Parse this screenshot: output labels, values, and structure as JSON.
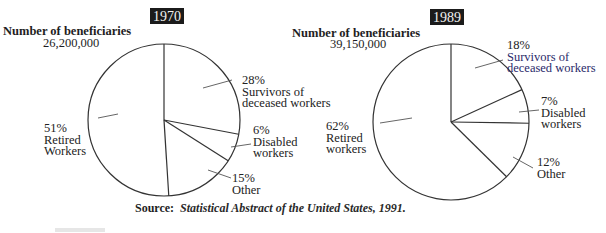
{
  "chart_data": [
    {
      "type": "pie",
      "title": "1970",
      "subtitle": "Number of beneficiaries",
      "total_label": "26,200,000",
      "total": 26200000,
      "categories": [
        "Survivors of deceased workers",
        "Disabled workers",
        "Other",
        "Retired Workers"
      ],
      "values": [
        28,
        6,
        15,
        51
      ],
      "unit": "%",
      "start_angle_deg": 0,
      "direction": "clockwise",
      "labels": [
        {
          "pct": "28%",
          "lines": [
            "Survivors of",
            "deceased workers"
          ]
        },
        {
          "pct": "6%",
          "lines": [
            "Disabled",
            "workers"
          ]
        },
        {
          "pct": "15%",
          "lines": [
            "Other"
          ]
        },
        {
          "pct": "51%",
          "lines": [
            "Retired",
            "Workers"
          ]
        }
      ]
    },
    {
      "type": "pie",
      "title": "1989",
      "subtitle": "Number of beneficiaries",
      "total_label": "39,150,000",
      "total": 39150000,
      "categories": [
        "Survivors of deceased workers",
        "Disabled workers",
        "Other",
        "Retired workers"
      ],
      "values": [
        18,
        7,
        12,
        62
      ],
      "unit": "%",
      "start_angle_deg": 0,
      "direction": "clockwise",
      "labels": [
        {
          "pct": "18%",
          "lines": [
            "Survivors of",
            "deceased workers"
          ]
        },
        {
          "pct": "7%",
          "lines": [
            "Disabled",
            "workers"
          ]
        },
        {
          "pct": "12%",
          "lines": [
            "Other"
          ]
        },
        {
          "pct": "62%",
          "lines": [
            "Retired",
            "workers"
          ]
        }
      ]
    }
  ],
  "source": {
    "prefix": "Source:",
    "text": "Statistical Abstract of the United States, 1991."
  }
}
